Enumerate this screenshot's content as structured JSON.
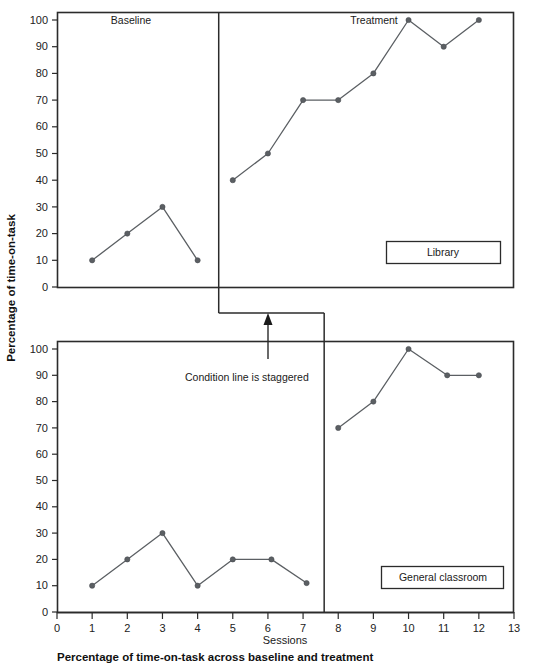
{
  "figure": {
    "caption": "Percentage of time-on-task across baseline and treatment",
    "ylabel": "Percentage of time-on-task",
    "xlabel": "Sessions",
    "annotation": "Condition line is staggered"
  },
  "chart_data": {
    "type": "line",
    "title": "Percentage of time-on-task across baseline and treatment",
    "xlabel": "Sessions",
    "ylabel": "Percentage of time-on-task",
    "xlim": [
      0,
      13
    ],
    "ylim": [
      0,
      100
    ],
    "xticks": [
      0,
      1,
      2,
      3,
      4,
      5,
      6,
      7,
      8,
      9,
      10,
      11,
      12,
      13
    ],
    "yticks": [
      0,
      10,
      20,
      30,
      40,
      50,
      60,
      70,
      80,
      90,
      100
    ],
    "grid": false,
    "legend_position": "inside-bottom-right",
    "panels": [
      {
        "name": "Library",
        "legend_label": "Library",
        "condition_line_x": 4.6,
        "phases": [
          {
            "label": "Baseline",
            "label_x": 2.1,
            "x": [
              1,
              2,
              3,
              4
            ],
            "y": [
              10,
              20,
              30,
              10
            ]
          },
          {
            "label": "Treatment",
            "label_x": 9.0,
            "x": [
              5,
              6,
              7,
              8,
              9,
              10,
              11,
              12
            ],
            "y": [
              40,
              50,
              70,
              70,
              80,
              100,
              90,
              100
            ]
          }
        ]
      },
      {
        "name": "General classroom",
        "legend_label": "General classroom",
        "condition_line_x": 7.6,
        "phases": [
          {
            "label": "Baseline",
            "label_x": null,
            "x": [
              1,
              2,
              3,
              4,
              5,
              6.1,
              7.1
            ],
            "y": [
              10,
              20,
              30,
              10,
              20,
              20,
              11
            ]
          },
          {
            "label": "Treatment",
            "label_x": null,
            "x": [
              8,
              9,
              10,
              11.1,
              12
            ],
            "y": [
              70,
              80,
              100,
              90,
              90
            ]
          }
        ]
      }
    ]
  }
}
